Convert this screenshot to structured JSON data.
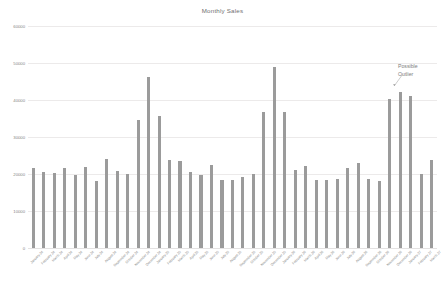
{
  "chart_data": {
    "type": "bar",
    "title": "Monthly Sales",
    "xlabel": "",
    "ylabel": "",
    "ylim": [
      0,
      60000
    ],
    "grid": true,
    "legend": false,
    "bar_color": "#9b9b9b",
    "yticks": [
      "60000",
      "50000",
      "40000",
      "30000",
      "20000",
      "10000",
      "0"
    ],
    "ytick_values": [
      60000,
      50000,
      40000,
      30000,
      20000,
      10000,
      0
    ],
    "categories": [
      "January 24",
      "February 24",
      "March 24",
      "April 24",
      "May 24",
      "June 24",
      "July 24",
      "August 24",
      "September 24",
      "October 24",
      "November 24",
      "December 24",
      "January 25",
      "February 25",
      "March 25",
      "April 25",
      "May 25",
      "June 25",
      "July 25",
      "August 25",
      "September 25",
      "October 25",
      "November 25",
      "December 25",
      "January 26",
      "February 26",
      "March 26",
      "April 26",
      "May 26",
      "June 26",
      "July 26",
      "August 26",
      "September 26",
      "October 26",
      "November 26",
      "December 26",
      "January 27",
      "February 27",
      "March 27"
    ],
    "values": [
      21500,
      20600,
      20200,
      21700,
      19700,
      22000,
      18000,
      24000,
      20700,
      20100,
      34500,
      46200,
      35800,
      23700,
      23500,
      20500,
      19800,
      22400,
      18300,
      18300,
      19100,
      20000,
      36700,
      48800,
      36800,
      21200,
      22300,
      18500,
      18300,
      18700,
      21700,
      23100,
      18700,
      18000,
      40300,
      42200,
      41000,
      20100,
      23700
    ],
    "annotations": [
      {
        "text_line1": "Possible",
        "text_line2": "Outlier",
        "target_index": 35
      }
    ]
  }
}
